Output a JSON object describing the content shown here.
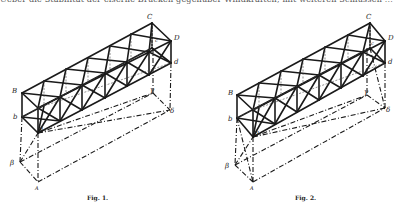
{
  "page": {
    "top_text": "Ueber die Stabilität der eiserne Brücken gegenüber Windkräften, mit weiteren Schlüssen ..."
  },
  "figures": [
    {
      "id": "fig1",
      "caption": "Fig. 1.",
      "labels": {
        "C": "C",
        "D": "D",
        "d": "d",
        "c": "c",
        "B": "B",
        "b": "b",
        "a": "a",
        "gamma": "γ",
        "delta": "δ",
        "beta": "β",
        "A": "A"
      }
    },
    {
      "id": "fig2",
      "caption": "Fig. 2.",
      "labels": {
        "C": "C",
        "D": "D",
        "d": "d",
        "c": "c",
        "B": "B",
        "b": "b",
        "a": "a",
        "gamma": "γ",
        "delta": "δ",
        "beta": "β",
        "A": "A"
      }
    }
  ]
}
